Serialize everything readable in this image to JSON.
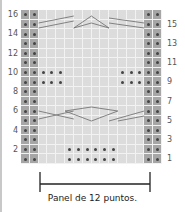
{
  "chart": {
    "columns": 16,
    "rows": 16,
    "edge_columns": [
      1,
      2,
      15,
      16
    ],
    "left_row_labels": [
      "16",
      "14",
      "12",
      "10",
      "8",
      "6",
      "4",
      "2"
    ],
    "right_row_labels": [
      "15",
      "13",
      "11",
      "9",
      "7",
      "5",
      "3",
      "1"
    ],
    "purl_rows": [
      {
        "rows": [
          9,
          10
        ],
        "columns": [
          3,
          4,
          5,
          12,
          13,
          14
        ]
      },
      {
        "rows": [
          1,
          2
        ],
        "columns": [
          6,
          7,
          8,
          9,
          10,
          11
        ]
      }
    ],
    "cable_rows": [
      5,
      6,
      15,
      16
    ],
    "colors": {
      "grid_bg": "#dcdcdc",
      "edge_bg": "#a6a6a6",
      "dot": "#444444",
      "cable_line": "#777777"
    }
  },
  "caption": "Panel de 12 puntos."
}
